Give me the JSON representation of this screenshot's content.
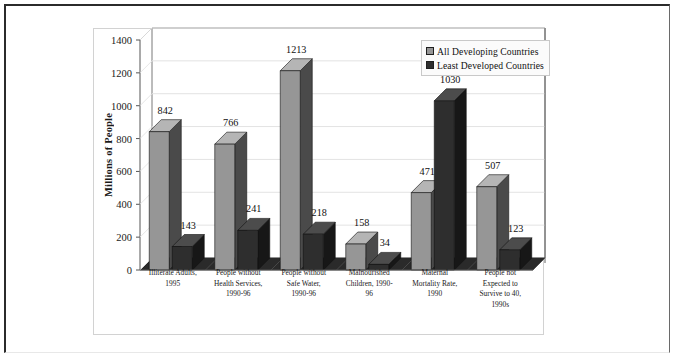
{
  "chart_data": {
    "type": "bar",
    "title": "",
    "xlabel": "",
    "ylabel": "Millions of People",
    "ylim": [
      0,
      1400
    ],
    "ytick_step": 200,
    "yticks": [
      "0",
      "200",
      "400",
      "600",
      "800",
      "1000",
      "1200",
      "1400"
    ],
    "grid": true,
    "legend_position": "top-right",
    "style": "3d-clustered-column",
    "categories": [
      "Illiterate Adults,\n1995",
      "People without\nHealth Services,\n1990-96",
      "People without\nSafe Water,\n1990-96",
      "Malnourished\nChildren, 1990-\n96",
      "Maternal\nMortality Rate,\n1990",
      "People not\nExpected to\nSurvive to 40,\n1990s"
    ],
    "series": [
      {
        "name": "All Developing Countries",
        "color": "#969696",
        "side_color": "#4a4a4a",
        "top_color": "#b5b5b5",
        "values": [
          842,
          766,
          1213,
          158,
          471,
          507
        ]
      },
      {
        "name": "Least Developed Countries",
        "color": "#2e2e2e",
        "side_color": "#171717",
        "top_color": "#4c4c4c",
        "values": [
          143,
          241,
          218,
          34,
          1030,
          123
        ]
      }
    ]
  },
  "colors": {
    "page_frame": "#2b2b2b",
    "plot_frame": "#d2d2d2",
    "gridline": "#e3e3e3",
    "axis_line": "#555555",
    "floor": "#2a2a2a",
    "back_wall": "#ffffff",
    "legend_bg": "#fbfbfb",
    "legend_border": "#c9c9c9",
    "text": "#111111"
  }
}
